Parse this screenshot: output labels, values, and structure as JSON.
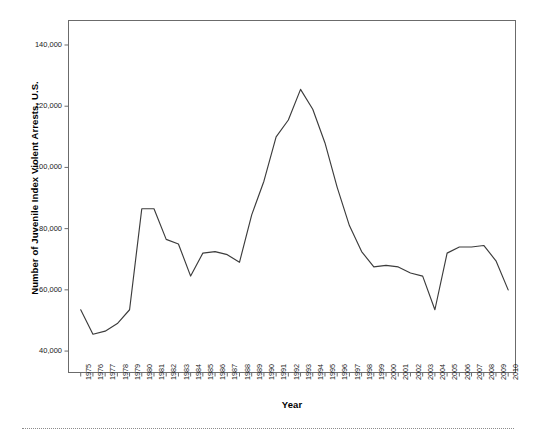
{
  "chart_data": {
    "type": "line",
    "title": "",
    "xlabel": "Year",
    "ylabel": "Number of Juvenile Index Violent Arrests, U.S.",
    "categories": [
      "1975",
      "1976",
      "1977",
      "1978",
      "1979",
      "1980",
      "1981",
      "1982",
      "1983",
      "1984",
      "1985",
      "1986",
      "1987",
      "1988",
      "1989",
      "1990",
      "1991",
      "1992",
      "1993",
      "1994",
      "1995",
      "1996",
      "1997",
      "1998",
      "1999",
      "2000",
      "2001",
      "2002",
      "2003",
      "2004",
      "2005",
      "2006",
      "2007",
      "2008",
      "2009",
      "2010"
    ],
    "values": [
      53500,
      45500,
      46500,
      49000,
      53500,
      86500,
      86500,
      76500,
      75000,
      64500,
      72000,
      72500,
      71500,
      69000,
      84500,
      95500,
      110000,
      115500,
      125500,
      119000,
      108000,
      93500,
      81000,
      72500,
      67500,
      68000,
      67500,
      65500,
      64500,
      53500,
      72000,
      74000,
      74000,
      74500,
      69500,
      60000
    ],
    "ylim": [
      33000,
      148000
    ],
    "yticks": [
      40000,
      60000,
      80000,
      100000,
      120000,
      140000
    ],
    "ytick_labels": [
      "40,000",
      "60,000",
      "80,000",
      "100,000",
      "120,000",
      "140,000"
    ],
    "grid": false,
    "legend": null,
    "line_color": "#3c3c3c",
    "axis_color": "#6b6b6b",
    "series": [
      {
        "name": "Juvenile Index Violent Arrests",
        "values": [
          53500,
          45500,
          46500,
          49000,
          53500,
          86500,
          86500,
          76500,
          75000,
          64500,
          72000,
          72500,
          71500,
          69000,
          84500,
          95500,
          110000,
          115500,
          125500,
          119000,
          108000,
          93500,
          81000,
          72500,
          67500,
          68000,
          67500,
          65500,
          64500,
          53500,
          72000,
          74000,
          74000,
          74500,
          69500,
          60000
        ]
      }
    ]
  }
}
